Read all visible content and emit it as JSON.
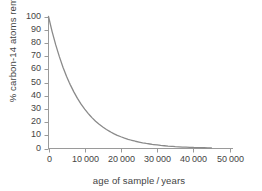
{
  "chart_data": {
    "type": "line",
    "title": "",
    "xlabel": "age of sample / years",
    "ylabel": "% carbon-14 atoms remaining",
    "xlim": [
      0,
      50000
    ],
    "ylim": [
      0,
      100
    ],
    "grid": false,
    "legend": null,
    "half_life_years": 5730,
    "model": "y = 100 * 0.5^(x / 5730)",
    "xticks": [
      0,
      10000,
      20000,
      30000,
      40000,
      50000
    ],
    "xtick_labels": [
      "0",
      "10 000",
      "20 000",
      "30 000",
      "40 000",
      "50 000"
    ],
    "yticks": [
      0,
      10,
      20,
      30,
      40,
      50,
      60,
      70,
      80,
      90,
      100
    ],
    "ytick_labels": [
      "0",
      "10",
      "20",
      "30",
      "40",
      "50",
      "60",
      "70",
      "80",
      "90",
      "100"
    ],
    "series": [
      {
        "name": "carbon-14 remaining",
        "color": "#8a8a8a",
        "x": [
          0,
          1000,
          2000,
          3000,
          4000,
          5000,
          5730,
          6000,
          7000,
          8000,
          9000,
          10000,
          11000,
          11460,
          12000,
          13000,
          14000,
          15000,
          16000,
          17000,
          17190,
          18000,
          19000,
          20000,
          21000,
          22000,
          22920,
          23000,
          24000,
          25000,
          26000,
          27000,
          28000,
          28650,
          29000,
          30000,
          31000,
          32000,
          33000,
          34000,
          34380,
          35000,
          36000,
          37000,
          38000,
          39000,
          40000,
          40110,
          41000,
          42000,
          43000,
          44000,
          45000
        ],
        "y": [
          100,
          88.6,
          78.5,
          69.6,
          61.6,
          54.6,
          50,
          48.4,
          42.9,
          38,
          33.6,
          29.8,
          26.4,
          25,
          23.4,
          20.7,
          18.4,
          16.3,
          14.4,
          12.8,
          12.5,
          11.3,
          10,
          8.9,
          7.9,
          7,
          6.25,
          6.2,
          5.5,
          4.9,
          4.3,
          3.8,
          3.4,
          3.12,
          3,
          2.7,
          2.3,
          2.1,
          1.8,
          1.6,
          1.56,
          1.4,
          1.3,
          1.1,
          1,
          0.9,
          0.8,
          0.78,
          0.7,
          0.6,
          0.55,
          0.48,
          0.43
        ]
      }
    ]
  },
  "figure": {
    "background_color": "#ffffff",
    "axis_color": "#9a9a9a",
    "text_color": "#444444",
    "curve_color": "#8a8a8a"
  }
}
